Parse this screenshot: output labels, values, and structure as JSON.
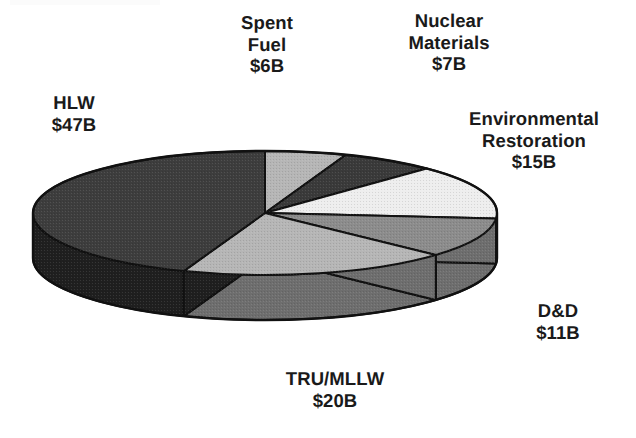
{
  "chart_data": {
    "type": "pie",
    "title": "",
    "subtitle": "",
    "xlabel": "",
    "ylabel": "",
    "units": "Billions of dollars (USD)",
    "value_prefix": "$",
    "value_suffix": "B",
    "total": 106,
    "legend_position": "none",
    "labels_position": "outside-callout",
    "grid": false,
    "three_d": true,
    "start_angle_deg": 0,
    "direction": "clockwise",
    "categories": [
      "Spent Fuel",
      "Nuclear Materials",
      "Environmental Restoration",
      "D&D",
      "TRU/MLLW",
      "HLW"
    ],
    "values": [
      6,
      7,
      15,
      11,
      20,
      47
    ],
    "slices": [
      {
        "id": "spent-fuel",
        "name": "Spent Fuel",
        "label_lines": [
          "Spent",
          "Fuel",
          "$6B"
        ],
        "value": 6,
        "value_text": "$6B",
        "percent": 5.7,
        "start_deg": 0,
        "end_deg": 20.4,
        "top_color": "#b6b6b6",
        "side_color": "#8f8f8f"
      },
      {
        "id": "nuclear-materials",
        "name": "Nuclear Materials",
        "label_lines": [
          "Nuclear",
          "Materials",
          "$7B"
        ],
        "value": 7,
        "value_text": "$7B",
        "percent": 6.6,
        "start_deg": 20.4,
        "end_deg": 44.2,
        "top_color": "#3a3a3a",
        "side_color": "#262626"
      },
      {
        "id": "environmental-restoration",
        "name": "Environmental Restoration",
        "label_lines": [
          "Environmental",
          "Restoration",
          "$15B"
        ],
        "value": 15,
        "value_text": "$15B",
        "percent": 14.2,
        "start_deg": 44.2,
        "end_deg": 95.2,
        "top_color": "#eeeeee",
        "side_color": "#8a8a8a"
      },
      {
        "id": "dd",
        "name": "D&D",
        "label_lines": [
          "D&D",
          "$11B"
        ],
        "value": 11,
        "value_text": "$11B",
        "percent": 10.4,
        "start_deg": 95.2,
        "end_deg": 132.6,
        "top_color": "#8c8c8c",
        "side_color": "#6e6e6e"
      },
      {
        "id": "tru-mllw",
        "name": "TRU/MLLW",
        "label_lines": [
          "TRU/MLLW",
          "$20B"
        ],
        "value": 20,
        "value_text": "$20B",
        "percent": 18.9,
        "start_deg": 132.6,
        "end_deg": 200.5,
        "top_color": "#b6b6b6",
        "side_color": "#6e6e6e"
      },
      {
        "id": "hlw",
        "name": "HLW",
        "label_lines": [
          "HLW",
          "$47B"
        ],
        "value": 47,
        "value_text": "$47B",
        "percent": 44.3,
        "start_deg": 200.5,
        "end_deg": 360,
        "top_color": "#3d3d3d",
        "side_color": "#1f1f1f"
      }
    ],
    "colors": {
      "background": "#ffffff",
      "outline": "#111111",
      "text": "#1a1a1a"
    },
    "geometry": {
      "cx": 265,
      "cy": 213,
      "rx": 232,
      "ry": 62,
      "depth": 45
    }
  },
  "labels": {
    "hlw": {
      "l1": "HLW",
      "l2": "$47B"
    },
    "spent_fuel": {
      "l1": "Spent",
      "l2": "Fuel",
      "l3": "$6B"
    },
    "nuclear_materials": {
      "l1": "Nuclear",
      "l2": "Materials",
      "l3": "$7B"
    },
    "environmental_restoration": {
      "l1": "Environmental",
      "l2": "Restoration",
      "l3": "$15B"
    },
    "dd": {
      "l1": "D&D",
      "l2": "$11B"
    },
    "tru_mllw": {
      "l1": "TRU/MLLW",
      "l2": "$20B"
    }
  }
}
